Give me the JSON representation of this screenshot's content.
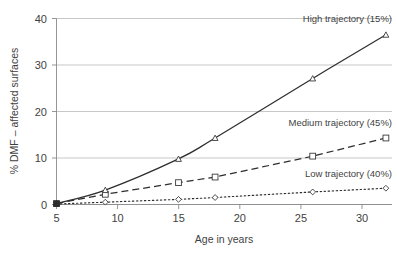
{
  "chart_data": {
    "type": "line",
    "title": "",
    "subtitle": "",
    "xlabel": "Age in years",
    "ylabel": "% DMF – affected surfaces",
    "xlim": [
      5,
      32.5
    ],
    "ylim": [
      0,
      40
    ],
    "xticks": [
      5,
      10,
      15,
      20,
      25,
      30
    ],
    "yticks": [
      0,
      10,
      20,
      30,
      40
    ],
    "xticklabels": [
      "5",
      "10",
      "15",
      "20",
      "25",
      "30"
    ],
    "yticklabels": [
      "0",
      "10",
      "20",
      "30",
      "40"
    ],
    "grid": "horizontal",
    "legend_position": "inline-annotations",
    "x": [
      5,
      9,
      15,
      18,
      26,
      32
    ],
    "series": [
      {
        "name": "High trajectory (15%)",
        "label": "High trajectory (15%)",
        "marker": "triangle",
        "linestyle": "solid",
        "color": "#2e2e2e",
        "values": [
          0.2,
          3.1,
          9.8,
          14.3,
          27.1,
          36.5
        ]
      },
      {
        "name": "Medium trajectory (45%)",
        "label": "Medium trajectory (45%)",
        "marker": "square",
        "linestyle": "dashed",
        "color": "#2e2e2e",
        "values": [
          0.2,
          2.2,
          4.7,
          5.9,
          10.4,
          14.3
        ]
      },
      {
        "name": "Low trajectory (40%)",
        "label": "Low trajectory (40%)",
        "marker": "diamond",
        "linestyle": "dotted",
        "color": "#2e2e2e",
        "values": [
          0.1,
          0.5,
          1.1,
          1.5,
          2.7,
          3.5
        ]
      }
    ],
    "annotations": [
      {
        "text": "High trajectory (15%)",
        "x": 27.5,
        "y": 38.6
      },
      {
        "text": "Medium trajectory (45%)",
        "x": 25.3,
        "y": 17.6
      },
      {
        "text": "Low trajectory (40%)",
        "x": 26.3,
        "y": 6.6
      }
    ]
  },
  "axes": {
    "x_title": "Age in years",
    "y_title": "% DMF – affected surfaces"
  },
  "colors": {
    "line": "#2e2e2e",
    "grid": "#b9b9b9",
    "axis": "#8a8a8a",
    "text": "#3f3f3f",
    "background": "#ffffff"
  }
}
